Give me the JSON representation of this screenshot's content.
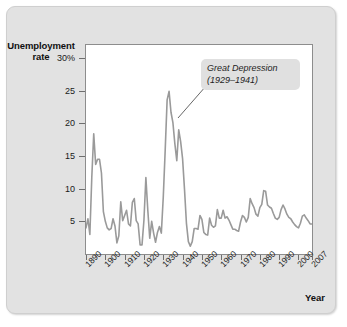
{
  "figure": {
    "background_color": "#e2e2e2",
    "plot_background_color": "#ffffff",
    "line_color": "#9a9a9a"
  },
  "annotation": {
    "line1": "Great Depression",
    "line2": "(1929–1941)"
  },
  "axis": {
    "y_title_line1": "Unemployment",
    "y_title_line2": "rate",
    "x_title": "Year"
  },
  "chart_data": {
    "type": "line",
    "title": "",
    "xlabel": "Year",
    "ylabel": "Unemployment rate",
    "grid": false,
    "legend": null,
    "xlim": [
      1890,
      2007
    ],
    "ylim": [
      0,
      32
    ],
    "ytick_labels": [
      "30%",
      "25",
      "20",
      "15",
      "10",
      "5"
    ],
    "ytick_values": [
      30,
      25,
      20,
      15,
      10,
      5
    ],
    "xtick_labels": [
      "1890",
      "1900",
      "1910",
      "1920",
      "1930",
      "1940",
      "1950",
      "1960",
      "1970",
      "1980",
      "1990",
      "2000",
      "2007"
    ],
    "xtick_values": [
      1890,
      1900,
      1910,
      1920,
      1930,
      1940,
      1950,
      1960,
      1970,
      1980,
      1990,
      2000,
      2007
    ],
    "annotations": [
      {
        "text": "Great Depression (1929–1941)",
        "points_to_year": 1933,
        "points_to_value": 24.9
      }
    ],
    "series": [
      {
        "name": "Unemployment rate",
        "color": "#9a9a9a",
        "x": [
          1890,
          1891,
          1892,
          1893,
          1894,
          1895,
          1896,
          1897,
          1898,
          1899,
          1900,
          1901,
          1902,
          1903,
          1904,
          1905,
          1906,
          1907,
          1908,
          1909,
          1910,
          1911,
          1912,
          1913,
          1914,
          1915,
          1916,
          1917,
          1918,
          1919,
          1920,
          1921,
          1922,
          1923,
          1924,
          1925,
          1926,
          1927,
          1928,
          1929,
          1930,
          1931,
          1932,
          1933,
          1934,
          1935,
          1936,
          1937,
          1938,
          1939,
          1940,
          1941,
          1942,
          1943,
          1944,
          1945,
          1946,
          1947,
          1948,
          1949,
          1950,
          1951,
          1952,
          1953,
          1954,
          1955,
          1956,
          1957,
          1958,
          1959,
          1960,
          1961,
          1962,
          1963,
          1964,
          1965,
          1966,
          1967,
          1968,
          1969,
          1970,
          1971,
          1972,
          1973,
          1974,
          1975,
          1976,
          1977,
          1978,
          1979,
          1980,
          1981,
          1982,
          1983,
          1984,
          1985,
          1986,
          1987,
          1988,
          1989,
          1990,
          1991,
          1992,
          1993,
          1994,
          1995,
          1996,
          1997,
          1998,
          1999,
          2000,
          2001,
          2002,
          2003,
          2004,
          2005,
          2006,
          2007
        ],
        "values": [
          4.0,
          5.4,
          3.0,
          11.7,
          18.4,
          13.7,
          14.5,
          14.5,
          12.4,
          6.5,
          5.0,
          4.0,
          3.7,
          3.9,
          5.4,
          4.3,
          1.7,
          2.8,
          8.0,
          5.1,
          5.9,
          6.7,
          4.6,
          4.3,
          7.9,
          8.5,
          5.1,
          4.6,
          1.4,
          1.4,
          5.2,
          11.7,
          6.7,
          2.4,
          5.0,
          3.2,
          1.8,
          3.3,
          4.2,
          3.2,
          8.7,
          15.9,
          23.6,
          24.9,
          21.7,
          20.1,
          16.9,
          14.3,
          19.0,
          17.2,
          14.6,
          9.9,
          4.7,
          1.9,
          1.2,
          1.9,
          3.9,
          3.9,
          3.8,
          5.9,
          5.3,
          3.3,
          3.0,
          2.9,
          5.5,
          4.4,
          4.1,
          4.3,
          6.8,
          5.5,
          5.5,
          6.7,
          5.5,
          5.7,
          5.2,
          4.5,
          3.8,
          3.8,
          3.6,
          3.5,
          4.9,
          5.9,
          5.6,
          4.9,
          5.6,
          8.5,
          7.7,
          7.1,
          6.1,
          5.8,
          7.1,
          7.6,
          9.7,
          9.6,
          7.5,
          7.2,
          7.0,
          6.2,
          5.5,
          5.3,
          5.6,
          6.8,
          7.5,
          6.9,
          6.1,
          5.6,
          5.4,
          4.9,
          4.5,
          4.2,
          4.0,
          4.7,
          5.8,
          6.0,
          5.5,
          5.1,
          4.6,
          4.6
        ]
      }
    ]
  }
}
